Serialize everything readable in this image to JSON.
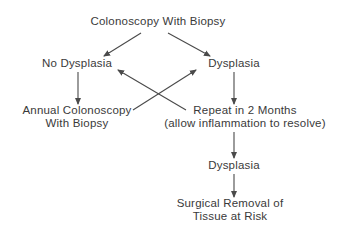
{
  "diagram": {
    "type": "flowchart",
    "colors": {
      "text": "#3a3a3a",
      "arrow": "#4a4a4a",
      "background": "#ffffff"
    },
    "nodes": {
      "start": {
        "lines": [
          "Colonoscopy With Biopsy"
        ]
      },
      "no_dysp": {
        "lines": [
          "No Dysplasia"
        ]
      },
      "dysp": {
        "lines": [
          "Dysplasia"
        ]
      },
      "annual": {
        "lines": [
          "Annual Colonoscopy",
          "With Biopsy"
        ]
      },
      "repeat": {
        "lines": [
          "Repeat in 2 Months",
          "(allow inflammation to resolve)"
        ]
      },
      "dysp2": {
        "lines": [
          "Dysplasia"
        ]
      },
      "surgery": {
        "lines": [
          "Surgical Removal of",
          "Tissue at Risk"
        ]
      }
    },
    "edges": [
      {
        "from": "start",
        "to": "no_dysp"
      },
      {
        "from": "start",
        "to": "dysp"
      },
      {
        "from": "no_dysp",
        "to": "annual"
      },
      {
        "from": "dysp",
        "to": "repeat"
      },
      {
        "from": "annual",
        "to": "dysp"
      },
      {
        "from": "repeat",
        "to": "no_dysp"
      },
      {
        "from": "repeat",
        "to": "dysp2"
      },
      {
        "from": "dysp2",
        "to": "surgery"
      }
    ]
  }
}
